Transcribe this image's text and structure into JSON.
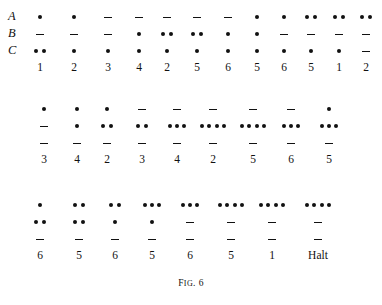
{
  "figure": {
    "caption": "Fig. 6",
    "caption_prefix": "F",
    "caption_smallcaps": "IG",
    "caption_suffix": ". 6",
    "row_labels": [
      "A",
      "B",
      "C"
    ],
    "halt_label": "Halt"
  },
  "chart_data": {
    "type": "table",
    "title": "Fig. 6",
    "xlabel": "",
    "ylabel": "",
    "row_labels": [
      "A",
      "B",
      "C"
    ],
    "blocks": [
      {
        "index": 1,
        "columns": 12,
        "rows": {
          "A": [
            1,
            1,
            "-",
            "-",
            "-",
            "-",
            "-",
            1,
            1,
            2,
            2,
            2
          ],
          "B": [
            "-",
            "-",
            "-",
            1,
            2,
            2,
            1,
            1,
            "-",
            "-",
            "-",
            "-"
          ],
          "C": [
            2,
            1,
            1,
            1,
            1,
            1,
            1,
            1,
            1,
            1,
            1,
            "-"
          ]
        },
        "labels": [
          "1",
          "2",
          "3",
          "4",
          "2",
          "5",
          "6",
          "5",
          "6",
          "5",
          "1",
          "2"
        ]
      },
      {
        "index": 2,
        "columns": 9,
        "rows": {
          "A": [
            1,
            1,
            1,
            "-",
            "-",
            "-",
            "-",
            "-",
            1
          ],
          "B": [
            "-",
            1,
            2,
            2,
            3,
            4,
            4,
            3,
            3
          ],
          "C": [
            "-",
            "-",
            "-",
            "-",
            "-",
            "-",
            "-",
            "-",
            "-"
          ]
        },
        "labels": [
          "3",
          "4",
          "2",
          "3",
          "4",
          "2",
          "5",
          "6",
          "5"
        ]
      },
      {
        "index": 3,
        "columns": 8,
        "rows": {
          "A": [
            1,
            2,
            2,
            3,
            3,
            4,
            4,
            4
          ],
          "B": [
            2,
            2,
            1,
            1,
            "-",
            "-",
            "-",
            "-"
          ],
          "C": [
            "-",
            "-",
            "-",
            "-",
            "-",
            "-",
            "-",
            "-"
          ]
        },
        "labels": [
          "6",
          "5",
          "6",
          "5",
          "6",
          "5",
          "1",
          "Halt"
        ]
      }
    ]
  },
  "layout": {
    "block_tops": [
      8,
      100,
      196
    ],
    "block_column_x": [
      [
        40,
        74,
        108,
        139,
        167,
        197,
        228,
        257,
        284,
        311,
        339,
        366
      ],
      [
        44,
        77,
        107,
        142,
        177,
        213,
        253,
        291,
        329
      ],
      [
        40,
        79,
        115,
        152,
        190,
        231,
        272,
        318
      ]
    ],
    "label_row_y": [
      63,
      150,
      246
    ]
  },
  "colors": {
    "ink": "#111111",
    "background": "#ffffff"
  }
}
